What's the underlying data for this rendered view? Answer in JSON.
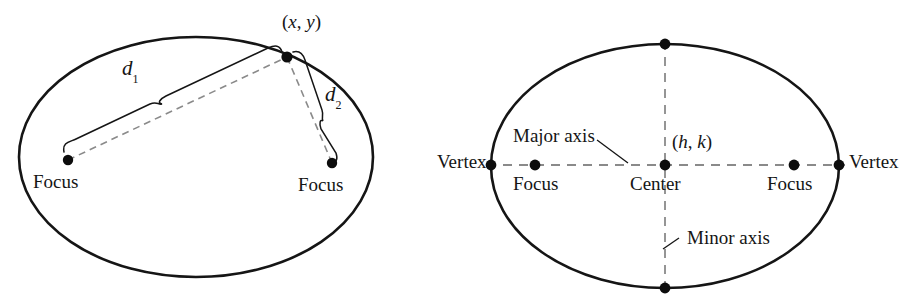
{
  "figure": {
    "background_color": "#ffffff",
    "stroke_color": "#151515",
    "dash_color": "#6e6e6e"
  },
  "left_diagram": {
    "name": "ellipse-focal-distance-definition",
    "ellipse": {
      "cx": 196,
      "cy": 157,
      "rx": 177,
      "ry": 120
    },
    "point_on_ellipse": {
      "label": "(x, y)",
      "label_open_paren": "(",
      "label_x": "x",
      "label_comma": ", ",
      "label_y": "y",
      "label_close_paren": ")",
      "x": 287,
      "y": 57
    },
    "focus_left": {
      "label": "Focus",
      "x": 68,
      "y": 160
    },
    "focus_right": {
      "label": "Focus",
      "x": 332,
      "y": 163
    },
    "distance_1": {
      "label": "d",
      "subscript": "1",
      "x": 128,
      "y": 70
    },
    "distance_2": {
      "label": "d",
      "subscript": "2",
      "x": 328,
      "y": 93
    }
  },
  "right_diagram": {
    "name": "ellipse-parts-labels",
    "ellipse": {
      "cx": 665,
      "cy": 166,
      "rx": 174,
      "ry": 122
    },
    "center": {
      "label": "Center",
      "coord_label": "(h, k)",
      "x": 665,
      "y": 165
    },
    "coord_parts": {
      "open_paren": "(",
      "h": "h",
      "comma": ", ",
      "k": "k",
      "close_paren": ")"
    },
    "vertex_left": {
      "label": "Vertex",
      "x": 491,
      "y": 164
    },
    "vertex_right": {
      "label": "Vertex",
      "x": 838,
      "y": 164
    },
    "focus_left": {
      "label": "Focus",
      "x": 535,
      "y": 164
    },
    "focus_right": {
      "label": "Focus",
      "x": 794,
      "y": 164
    },
    "major_axis": {
      "label": "Major axis"
    },
    "minor_axis": {
      "label": "Minor axis"
    }
  }
}
